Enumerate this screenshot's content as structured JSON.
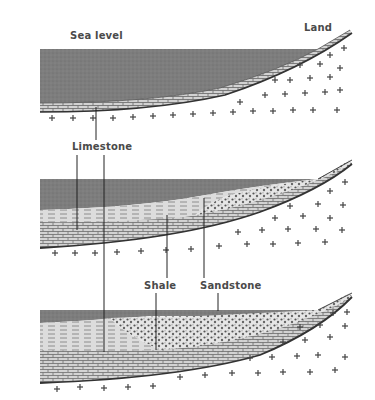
{
  "page_number": "",
  "labels": {
    "sea_level": "Sea level",
    "land": "Land",
    "limestone": "Limestone",
    "shale": "Shale",
    "sandstone": "Sandstone"
  },
  "panels": [
    {
      "stage": 1,
      "description": "Sea covers basin; thin limestone layer on floor over crystalline basement"
    },
    {
      "stage": 2,
      "description": "Sea shallows; sandstone builds near shore over shale and limestone"
    },
    {
      "stage": 3,
      "description": "Sea very shallow; thick sandstone, shale and limestone layers fill basin"
    }
  ],
  "colors": {
    "sea": "#7a7a7a",
    "line": "#333333",
    "basement_cross": "#444444",
    "paper": "#ffffff"
  }
}
